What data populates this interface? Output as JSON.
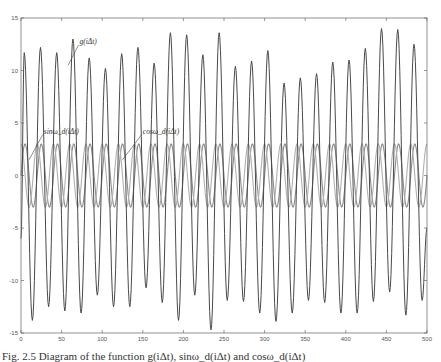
{
  "chart_data": {
    "type": "line",
    "title": "",
    "xlabel": "",
    "ylabel": "",
    "xlim": [
      0,
      500
    ],
    "ylim": [
      -15,
      15
    ],
    "xticks": [
      0,
      50,
      100,
      150,
      200,
      250,
      300,
      350,
      400,
      450,
      500
    ],
    "yticks": [
      15,
      10,
      5,
      0,
      -5,
      -10,
      -15
    ],
    "grid": false,
    "legend": null,
    "period_x": 20,
    "series": [
      {
        "name": "g(iΔt)",
        "kind": "oscillating signal with varying amplitude",
        "peaks_x": [
          4,
          24,
          44,
          64,
          84,
          104,
          124,
          144,
          164,
          184,
          204,
          224,
          244,
          264,
          284,
          304,
          324,
          344,
          364,
          384,
          404,
          424,
          444,
          464,
          484
        ],
        "peaks_y": [
          11.7,
          12.2,
          11.7,
          13.0,
          11.2,
          10.2,
          11.6,
          12.2,
          10.7,
          13.6,
          13.4,
          11.5,
          13.6,
          10.4,
          10.9,
          11.9,
          8.8,
          9.3,
          9.7,
          10.8,
          11.0,
          12.1,
          14.0,
          13.9,
          12.5
        ],
        "troughs_x": [
          14,
          34,
          54,
          74,
          94,
          114,
          134,
          154,
          174,
          194,
          214,
          234,
          254,
          274,
          294,
          314,
          334,
          354,
          374,
          394,
          414,
          434,
          454,
          474,
          494
        ],
        "troughs_y": [
          -13.8,
          -12.5,
          -12.9,
          -13.1,
          -11.4,
          -12.5,
          -12.5,
          -10.7,
          -12.1,
          -13.8,
          -11.4,
          -14.7,
          -11.9,
          -12.0,
          -13.1,
          -13.9,
          -13.1,
          -11.9,
          -12.1,
          -13.1,
          -13.1,
          -12.0,
          -11.1,
          -13.3,
          -11.9
        ]
      },
      {
        "name": "sin ω_d(iΔt)",
        "kind": "sinusoid",
        "amplitude": 3,
        "period": 20,
        "phase_deg": 0
      },
      {
        "name": "cos ω_d(iΔt)",
        "kind": "sinusoid",
        "amplitude": 3,
        "period": 20,
        "phase_deg": 90
      }
    ],
    "annotations": [
      {
        "text": "g(iΔt)",
        "x": 72,
        "y": 12.5,
        "arrow_to_x": 58,
        "arrow_to_y": 10.5
      },
      {
        "text": "sinω_d(iΔt)",
        "x": 28,
        "y": 4.0,
        "arrow_to_x": 10,
        "arrow_to_y": 1.5
      },
      {
        "text": "cosω_d(iΔt)",
        "x": 150,
        "y": 4.0,
        "arrow_to_x": 125,
        "arrow_to_y": 1.5
      }
    ]
  },
  "caption": {
    "text": "Fig. 2.5  Diagram of the function g(iΔt), sinω_d(iΔt) and cosω_d(iΔt)"
  },
  "colors": {
    "background": "#ffffff",
    "axis": "#555555",
    "signal": "#4a4a4a",
    "sin": "#8a8a8a",
    "cos": "#b0b0b0"
  }
}
